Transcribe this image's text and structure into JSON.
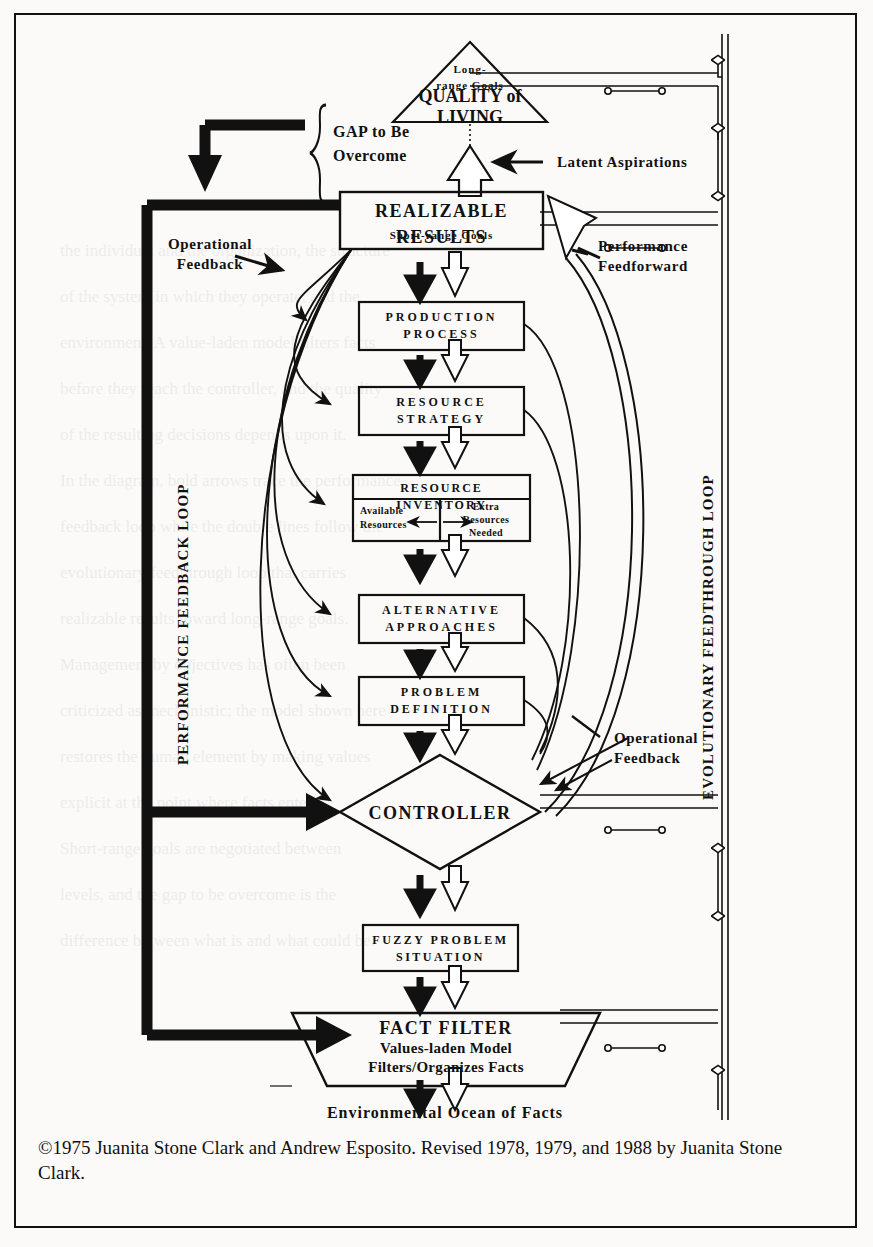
{
  "document": {
    "type": "flow-diagram",
    "caption": "©1975 Juanita Stone Clark and Andrew Esposito. Revised 1978, 1979, and 1988 by Juanita Stone Clark."
  },
  "diagram": {
    "triangle": {
      "small_label_line1": "Long-",
      "small_label_line2": "range Goals",
      "title_line1": "QUALITY of",
      "title_line2": "LIVING"
    },
    "gap_brace": {
      "line1": "GAP to Be",
      "line2": "Overcome"
    },
    "realizable": {
      "title": "REALIZABLE  RESULTS",
      "subtitle": "Short-range Goals"
    },
    "boxes": [
      {
        "id": "production-process",
        "line1": "PRODUCTION",
        "line2": "PROCESS"
      },
      {
        "id": "resource-strategy",
        "line1": "RESOURCE",
        "line2": "STRATEGY"
      },
      {
        "id": "alternative-approaches",
        "line1": "ALTERNATIVE",
        "line2": "APPROACHES"
      },
      {
        "id": "problem-definition",
        "line1": "PROBLEM",
        "line2": "DEFINITION"
      },
      {
        "id": "fuzzy-problem-situation",
        "line1": "FUZZY PROBLEM",
        "line2": "SITUATION"
      }
    ],
    "resource_inventory": {
      "header": "RESOURCE    INVENTORY",
      "left_line1": "Available",
      "left_line2": "Resources",
      "right_line1": "Extra",
      "right_line2": "Resources",
      "right_line3": "Needed"
    },
    "controller": {
      "label": "CONTROLLER"
    },
    "fact_filter": {
      "line1": "FACT FILTER",
      "line2": "Values-laden Model",
      "line3": "Filters/Organizes Facts"
    },
    "ocean": {
      "label": "Environmental Ocean of Facts"
    },
    "annotations": {
      "latent_aspirations": "Latent Aspirations",
      "operational_feedback_left_line1": "Operational",
      "operational_feedback_left_line2": "Feedback",
      "performance_feedforward_line1": "Performance",
      "performance_feedforward_line2": "Feedforward",
      "operational_feedback_right_line1": "Operational",
      "operational_feedback_right_line2": "Feedback"
    },
    "loops": {
      "left_vertical": "PERFORMANCE FEEDBACK LOOP",
      "right_vertical": "EVOLUTIONARY FEEDTHROUGH LOOP"
    },
    "colors": {
      "ink": "#111111",
      "paper": "#fbfaf8"
    }
  },
  "ghost_text": {
    "lines": [
      "the individual and the organization, the structure",
      "of the system in which they operate, and the",
      "environment. A value-laden model filters facts",
      "before they reach the controller, and the quality",
      "of the resulting decisions depends upon it.",
      "In the diagram, bold arrows trace the performance",
      "feedback loop while the double lines follow the",
      "evolutionary feedthrough loop that carries",
      "realizable results toward long-range goals.",
      "Management by objectives has often been",
      "criticized as mechanistic; the model shown here",
      "restores the human element by making values",
      "explicit at the point where facts enter.",
      "Short-range goals are negotiated between",
      "levels, and the gap to be overcome is the",
      "difference between what is and what could be."
    ]
  }
}
